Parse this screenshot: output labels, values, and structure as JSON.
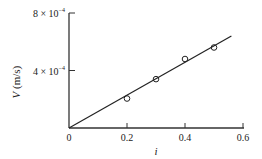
{
  "chart_data": {
    "type": "scatter",
    "title": "",
    "xlabel": "i",
    "ylabel": "V (m/s)",
    "xlim": [
      0,
      0.6
    ],
    "ylim": [
      0,
      0.0008
    ],
    "x_ticks": [
      0,
      0.2,
      0.4,
      0.6
    ],
    "x_tick_labels": [
      "0",
      "0.2",
      "0.4",
      "0.6"
    ],
    "y_ticks": [
      0.0004,
      0.0008
    ],
    "y_tick_labels": [
      {
        "mantissa": "4 × 10",
        "exp": "−4"
      },
      {
        "mantissa": "8 × 10",
        "exp": "−4"
      }
    ],
    "grid": false,
    "legend": null,
    "series": [
      {
        "name": "measured",
        "marker": "open-circle",
        "x": [
          0.2,
          0.3,
          0.4,
          0.5
        ],
        "y": [
          0.000205,
          0.00034,
          0.00048,
          0.00056
        ]
      },
      {
        "name": "fit line",
        "style": "line",
        "x": [
          0,
          0.56
        ],
        "y": [
          0,
          0.00064
        ]
      }
    ]
  }
}
